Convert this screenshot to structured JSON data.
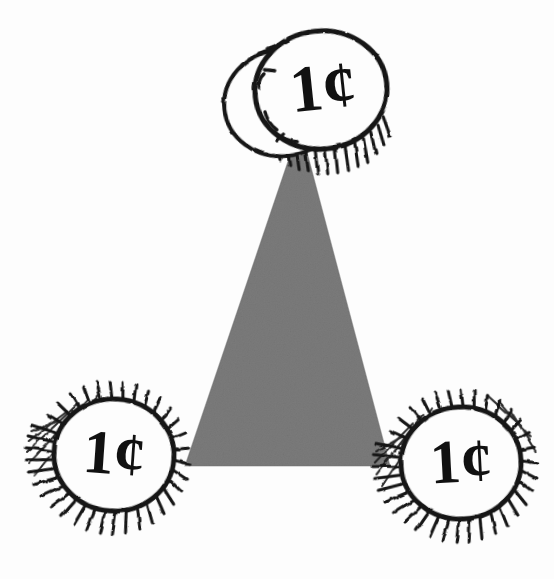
{
  "illustration": {
    "title": "Three coins at the vertices of a shaded triangle",
    "style": "hand-drawn pen-and-ink line art with radial hatching",
    "background_color": "#fdfdfd",
    "ink_color": "#111111",
    "coin_face_color": "#fdfdfd",
    "triangle": {
      "name": "shaded-triangle",
      "fill_color": "#7b7b7b",
      "texture": "mottled grain",
      "apex": {
        "x": 300,
        "y": 128
      },
      "bottom_left": {
        "x": 186,
        "y": 466
      },
      "bottom_right": {
        "x": 389,
        "y": 466
      }
    },
    "coins": [
      {
        "id": "coin-top",
        "label": "1¢",
        "denomination_digit": "1",
        "currency_symbol": "¢",
        "center": {
          "x": 321,
          "y": 90
        },
        "radius_x": 66,
        "radius_y": 59,
        "rotation_deg": -6,
        "hatching_sides": "left and bottom",
        "has_back_coin": true,
        "back_coin_center": {
          "x": 281,
          "y": 99
        },
        "back_coin_radius_x": 58,
        "back_coin_radius_y": 53
      },
      {
        "id": "coin-bottom-left",
        "label": "1¢",
        "denomination_digit": "1",
        "currency_symbol": "¢",
        "center": {
          "x": 114,
          "y": 455
        },
        "radius_x": 60,
        "radius_y": 56,
        "rotation_deg": 4,
        "hatching_sides": "all around",
        "has_back_coin": false
      },
      {
        "id": "coin-bottom-right",
        "label": "1¢",
        "denomination_digit": "1",
        "currency_symbol": "¢",
        "center": {
          "x": 461,
          "y": 463
        },
        "radius_x": 60,
        "radius_y": 56,
        "rotation_deg": -3,
        "hatching_sides": "all around",
        "has_back_coin": false
      }
    ],
    "coin_count": 3,
    "total_value_label": "3¢"
  }
}
